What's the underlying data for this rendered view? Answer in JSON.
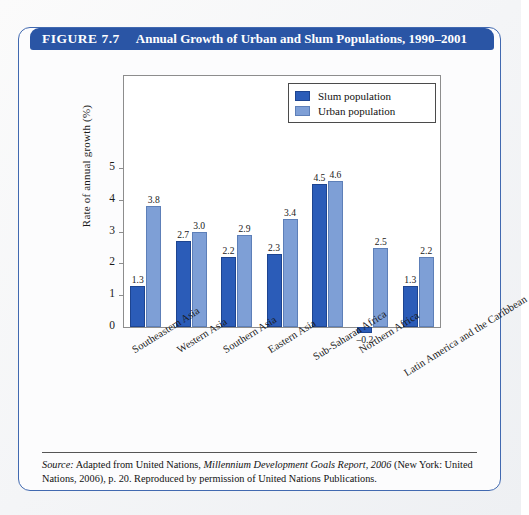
{
  "figure": {
    "label": "FIGURE 7.7",
    "title": "Annual Growth of Urban and Slum Populations, 1990–2001",
    "source_prefix": "Source:",
    "source_text_1": " Adapted from United Nations, ",
    "source_italic": "Millennium Development Goals Report, 2006",
    "source_text_2": " (New York: United Nations, 2006), p. 20. Reproduced by permission of United Nations Publications."
  },
  "legend": {
    "items": [
      {
        "label": "Slum population",
        "color": "#2b5cb8",
        "key": "slum"
      },
      {
        "label": "Urban population",
        "color": "#7e9fd6",
        "key": "urban"
      }
    ]
  },
  "chart_data": {
    "type": "bar",
    "title": "Annual Growth of Urban and Slum Populations, 1990–2001",
    "xlabel": "",
    "ylabel": "Rate of annual growth (%)",
    "ylim": [
      -0.5,
      5.4
    ],
    "yticks": [
      0,
      1,
      2,
      3,
      4,
      5
    ],
    "ytick_labels": [
      "0",
      "1",
      "2",
      "3",
      "4",
      "5"
    ],
    "grid": false,
    "legend_position": "top-right",
    "categories": [
      "Southeastern Asia",
      "Western Asia",
      "Southern Asia",
      "Eastern Asia",
      "Sub-Saharan Africa",
      "Northern Africa",
      "Latin America and the Caribbean"
    ],
    "series": [
      {
        "name": "Slum population",
        "color": "#2b5cb8",
        "values": [
          1.3,
          2.7,
          2.2,
          2.3,
          4.5,
          -0.2,
          1.3
        ],
        "labels": [
          "1.3",
          "2.7",
          "2.2",
          "2.3",
          "4.5",
          "–0.2",
          "1.3"
        ]
      },
      {
        "name": "Urban population",
        "color": "#7e9fd6",
        "values": [
          3.8,
          3.0,
          2.9,
          3.4,
          4.6,
          2.5,
          2.2
        ],
        "labels": [
          "3.8",
          "3.0",
          "2.9",
          "3.4",
          "4.6",
          "2.5",
          "2.2"
        ]
      }
    ]
  }
}
